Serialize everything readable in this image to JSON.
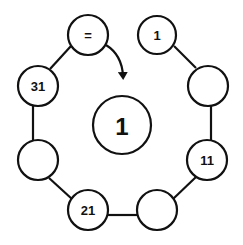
{
  "diagram": {
    "center": {
      "label": "1"
    },
    "nodes": [
      {
        "id": "top-left",
        "label": "="
      },
      {
        "id": "top-right",
        "label": "1"
      },
      {
        "id": "right-upper",
        "label": ""
      },
      {
        "id": "right-lower",
        "label": "11"
      },
      {
        "id": "bottom-right",
        "label": ""
      },
      {
        "id": "bottom-left",
        "label": "21"
      },
      {
        "id": "left-lower",
        "label": ""
      },
      {
        "id": "left-upper",
        "label": "31"
      }
    ],
    "colors": {
      "stroke": "#111111",
      "background": "#ffffff"
    }
  }
}
